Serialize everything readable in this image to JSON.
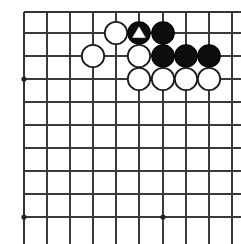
{
  "diagram": {
    "kind": "go-board-diagram",
    "board": {
      "width_px": 241,
      "height_px": 244,
      "background_color": "#ffffff",
      "line_color": "#3a3a3a",
      "edge_line_color": "#333333",
      "columns": 10,
      "rows": 10,
      "column_x": [
        24,
        47,
        70,
        93,
        116,
        139,
        163,
        186,
        209,
        232
      ],
      "row_y": [
        12,
        33,
        56,
        79,
        102,
        125,
        148,
        171,
        194,
        217
      ],
      "column_spacing_px": 23,
      "row_spacing_px": 22.8,
      "stone_radius_px": 11.2
    },
    "star_points": [
      {
        "name": "star-point-left-upper",
        "col": 0,
        "row": 3
      },
      {
        "name": "star-point-left-lower",
        "col": 0,
        "row": 9
      },
      {
        "name": "star-point-center-lower",
        "col": 6,
        "row": 9
      }
    ],
    "stones": [
      {
        "name": "white-stone-c5-r2",
        "color": "white",
        "col": 4,
        "row": 1,
        "mark": "none",
        "color_hex": "#ffffff"
      },
      {
        "name": "black-stone-c6-r2-marked",
        "color": "black",
        "col": 5,
        "row": 1,
        "mark": "triangle",
        "color_hex": "#0d0d0d"
      },
      {
        "name": "black-stone-c7-r2",
        "color": "black",
        "col": 6,
        "row": 1,
        "mark": "none",
        "color_hex": "#0d0d0d"
      },
      {
        "name": "white-stone-c4-r3",
        "color": "white",
        "col": 3,
        "row": 2,
        "mark": "none",
        "color_hex": "#ffffff"
      },
      {
        "name": "white-stone-c6-r3",
        "color": "white",
        "col": 5,
        "row": 2,
        "mark": "none",
        "color_hex": "#ffffff"
      },
      {
        "name": "black-stone-c7-r3",
        "color": "black",
        "col": 6,
        "row": 2,
        "mark": "none",
        "color_hex": "#0d0d0d"
      },
      {
        "name": "black-stone-c8-r3",
        "color": "black",
        "col": 7,
        "row": 2,
        "mark": "none",
        "color_hex": "#0d0d0d"
      },
      {
        "name": "black-stone-c9-r3",
        "color": "black",
        "col": 8,
        "row": 2,
        "mark": "none",
        "color_hex": "#0d0d0d"
      },
      {
        "name": "white-stone-c6-r4",
        "color": "white",
        "col": 5,
        "row": 3,
        "mark": "none",
        "color_hex": "#ffffff"
      },
      {
        "name": "white-stone-c7-r4",
        "color": "white",
        "col": 6,
        "row": 3,
        "mark": "none",
        "color_hex": "#ffffff"
      },
      {
        "name": "white-stone-c8-r4",
        "color": "white",
        "col": 7,
        "row": 3,
        "mark": "none",
        "color_hex": "#ffffff"
      },
      {
        "name": "white-stone-c9-r4",
        "color": "white",
        "col": 8,
        "row": 3,
        "mark": "none",
        "color_hex": "#ffffff"
      }
    ]
  }
}
